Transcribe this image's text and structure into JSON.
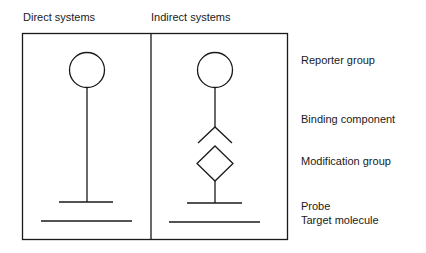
{
  "panels": {
    "left_title": "Direct systems",
    "right_title": "Indirect systems"
  },
  "legend": {
    "reporter": "Reporter group",
    "binding": "Binding component",
    "modification": "Modification group",
    "probe": "Probe",
    "target": "Target molecule"
  },
  "colors": {
    "stroke": "#1a1a1a",
    "background": "#ffffff"
  }
}
